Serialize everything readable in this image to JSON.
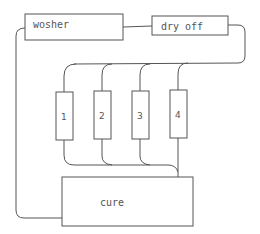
{
  "diagram": {
    "title": "",
    "nodes": [
      {
        "id": "washer",
        "label": "wosher"
      },
      {
        "id": "dry_off",
        "label": "dry off"
      },
      {
        "id": "station_1",
        "label": "1"
      },
      {
        "id": "station_2",
        "label": "2"
      },
      {
        "id": "station_3",
        "label": "3"
      },
      {
        "id": "station_4",
        "label": "4"
      },
      {
        "id": "cure",
        "label": "cure"
      }
    ],
    "edges": [
      {
        "from": "washer",
        "to": "dry_off"
      },
      {
        "from": "dry_off",
        "to": "station_1"
      },
      {
        "from": "dry_off",
        "to": "station_2"
      },
      {
        "from": "dry_off",
        "to": "station_3"
      },
      {
        "from": "dry_off",
        "to": "station_4"
      },
      {
        "from": "station_1",
        "to": "cure"
      },
      {
        "from": "station_2",
        "to": "cure"
      },
      {
        "from": "station_3",
        "to": "cure"
      },
      {
        "from": "station_4",
        "to": "cure"
      },
      {
        "from": "cure",
        "to": "washer"
      }
    ],
    "colors": {
      "stroke": "#555555",
      "background": "#ffffff"
    }
  }
}
